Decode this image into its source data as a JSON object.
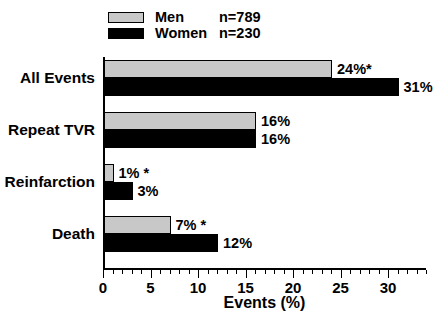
{
  "chart_data": {
    "type": "bar",
    "orientation": "horizontal",
    "title": "",
    "xlabel": "Events (%)",
    "ylabel": "",
    "xlim": [
      0,
      34
    ],
    "xticks": [
      0,
      5,
      10,
      15,
      20,
      25,
      30
    ],
    "xtick_labels": [
      "0",
      "5",
      "10",
      "15",
      "20",
      "25",
      "30"
    ],
    "minor_tick_interval": 1,
    "grid": false,
    "categories": [
      "All Events",
      "Repeat TVR",
      "Reinfarction",
      "Death"
    ],
    "series": [
      {
        "name": "Men",
        "n_label": "n=789",
        "color": "#c8c8c8",
        "values": [
          24,
          16,
          1,
          7
        ],
        "value_labels": [
          "24%*",
          "16%",
          "1% *",
          "7% *"
        ],
        "significant": [
          true,
          false,
          true,
          true
        ]
      },
      {
        "name": "Women",
        "n_label": "n=230",
        "color": "#000000",
        "values": [
          31,
          16,
          3,
          12
        ],
        "value_labels": [
          "31%",
          "16%",
          "3%",
          "12%"
        ],
        "significant": [
          false,
          false,
          false,
          false
        ]
      }
    ],
    "legend_position": "top-left",
    "significance_marker": "*"
  },
  "legend": {
    "rows": [
      {
        "label": "Men",
        "n": "n=789"
      },
      {
        "label": "Women",
        "n": "n=230"
      }
    ]
  },
  "axis": {
    "x_title": "Events (%)"
  }
}
